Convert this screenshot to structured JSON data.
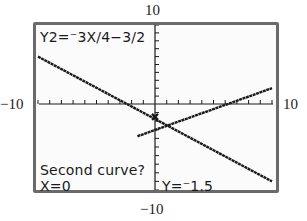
{
  "window": {
    "xmin_label": "−10",
    "xmax_label": "10",
    "ymin_label": "−10",
    "ymax_label": "10"
  },
  "screen": {
    "equation": "Y2=⁻3X/4−3/2",
    "prompt": "Second curve?",
    "x_readout": "X=0",
    "y_readout": "Y=⁻1.5"
  },
  "colors": {
    "border": "#6a6a6a",
    "screen_bg": "#fbfbfb",
    "ink": "#1a1a1a"
  },
  "chart_data": {
    "type": "line",
    "title": "",
    "xlabel": "",
    "ylabel": "",
    "xlim": [
      -10,
      10
    ],
    "ylim": [
      -10,
      10
    ],
    "xscl": 1,
    "yscl": 1,
    "grid": false,
    "series": [
      {
        "name": "Y1",
        "equation": "Y1 = X/2 - 3 (approx, rising line)",
        "x": [
          -1.5,
          10
        ],
        "y": [
          -3.75,
          2
        ]
      },
      {
        "name": "Y2",
        "equation": "Y2 = -3X/4 - 3/2",
        "x": [
          -10,
          10
        ],
        "y": [
          6,
          -9
        ]
      }
    ],
    "cursor": {
      "x": 0,
      "y": -1.5,
      "on": "Y2"
    },
    "annotations": [
      "Y2=-3X/4-3/2",
      "Second curve?",
      "X=0",
      "Y=-1.5"
    ]
  }
}
